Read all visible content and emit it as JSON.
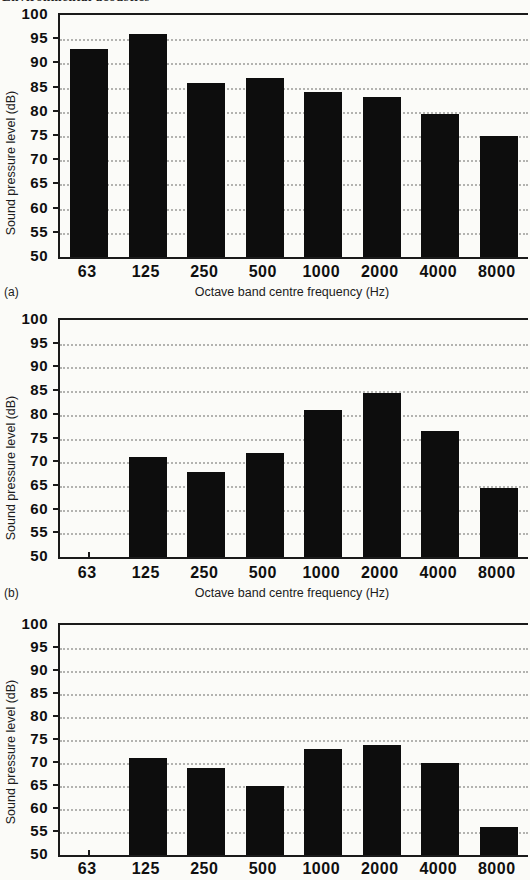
{
  "header": {
    "clipped_text": "Environmental acoustics"
  },
  "colors": {
    "background": "#fbfbf8",
    "bar": "#0d0d0d",
    "axis": "#1a1a1a",
    "gridline": "#b3b3b0",
    "text": "#111111"
  },
  "chart_data": [
    {
      "type": "bar",
      "caption": "(a)",
      "title": "",
      "ylabel": "Sound pressure level (dB)",
      "xlabel": "Octave band centre frequency (Hz)",
      "categories": [
        "63",
        "125",
        "250",
        "500",
        "1000",
        "2000",
        "4000",
        "8000"
      ],
      "values": [
        93,
        96,
        86,
        87,
        84,
        83,
        79.5,
        75
      ],
      "ylim": [
        50,
        100
      ],
      "ytick_step": 5,
      "grid": "dotted-horizontal",
      "legend": "none"
    },
    {
      "type": "bar",
      "caption": "(b)",
      "title": "",
      "ylabel": "Sound pressure level (dB)",
      "xlabel": "Octave band centre frequency (Hz)",
      "categories": [
        "63",
        "125",
        "250",
        "500",
        "1000",
        "2000",
        "4000",
        "8000"
      ],
      "values": [
        null,
        71,
        68,
        72,
        81,
        84.5,
        76.5,
        64.5
      ],
      "ylim": [
        50,
        100
      ],
      "ytick_step": 5,
      "grid": "dotted-horizontal",
      "legend": "none"
    },
    {
      "type": "bar",
      "caption": "",
      "title": "",
      "ylabel": "Sound pressure level (dB)",
      "xlabel": "",
      "categories": [
        "63",
        "125",
        "250",
        "500",
        "1000",
        "2000",
        "4000",
        "8000"
      ],
      "values": [
        null,
        71,
        69,
        65,
        73,
        74,
        70,
        56
      ],
      "ylim": [
        50,
        100
      ],
      "ytick_step": 5,
      "grid": "dotted-horizontal",
      "legend": "none"
    }
  ]
}
